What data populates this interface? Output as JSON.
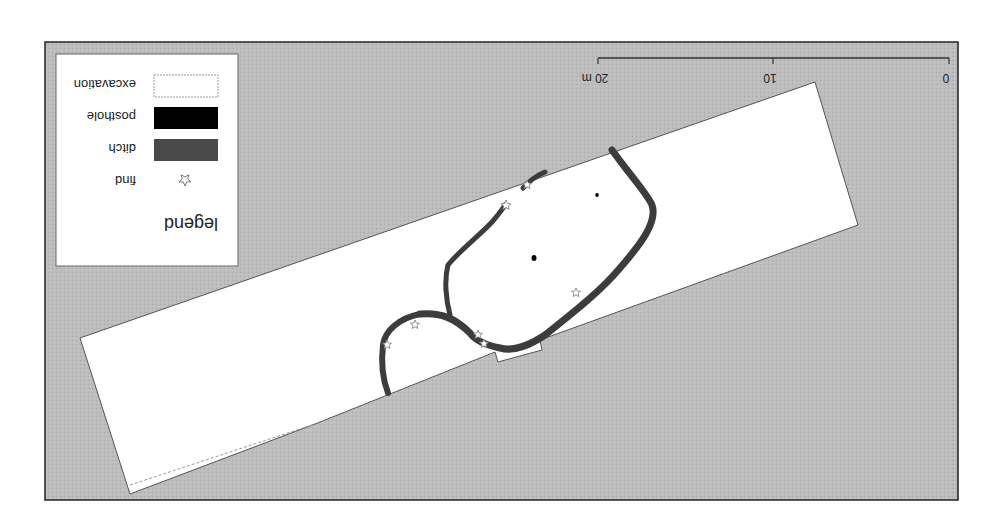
{
  "orientation": "rotated 180 degrees",
  "legend": {
    "title": "legend",
    "items": [
      {
        "label": "find",
        "symbol": "star-icon"
      },
      {
        "label": "ditch",
        "symbol": "dark-gray-fill",
        "color": "#4a4a4a"
      },
      {
        "label": "posthole",
        "symbol": "black-fill",
        "color": "#000000"
      },
      {
        "label": "excavation",
        "symbol": "white-fill-dashed-outline",
        "color": "#ffffff"
      }
    ]
  },
  "scale_bar": {
    "ticks": [
      "0",
      "10",
      "20 m"
    ],
    "unit": "m"
  },
  "colors": {
    "background": "#bdbdbd",
    "excavation": "#ffffff",
    "ditch": "#3c3c3c",
    "posthole": "#000000",
    "frame": "#222222"
  }
}
